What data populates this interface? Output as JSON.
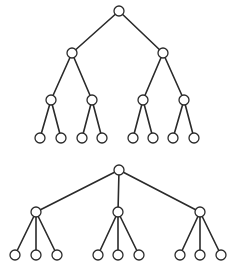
{
  "diagram": {
    "type": "tree-comparison",
    "style": {
      "line_color": "#2a2a2a",
      "node_fill": "#ffffff",
      "node_radius": 5
    },
    "trees": [
      {
        "name": "binary-tree",
        "branching_factor": 2,
        "depth": 3,
        "nodes": [
          {
            "id": "b0",
            "x": 119,
            "y": 11
          },
          {
            "id": "b1",
            "x": 72,
            "y": 53
          },
          {
            "id": "b2",
            "x": 163,
            "y": 53
          },
          {
            "id": "b3",
            "x": 51,
            "y": 100
          },
          {
            "id": "b4",
            "x": 92,
            "y": 100
          },
          {
            "id": "b5",
            "x": 143,
            "y": 100
          },
          {
            "id": "b6",
            "x": 184,
            "y": 100
          },
          {
            "id": "b7",
            "x": 40,
            "y": 138
          },
          {
            "id": "b8",
            "x": 61,
            "y": 138
          },
          {
            "id": "b9",
            "x": 82,
            "y": 138
          },
          {
            "id": "b10",
            "x": 102,
            "y": 138
          },
          {
            "id": "b11",
            "x": 133,
            "y": 138
          },
          {
            "id": "b12",
            "x": 153,
            "y": 138
          },
          {
            "id": "b13",
            "x": 173,
            "y": 138
          },
          {
            "id": "b14",
            "x": 194,
            "y": 138
          }
        ],
        "edges": [
          [
            "b0",
            "b1"
          ],
          [
            "b0",
            "b2"
          ],
          [
            "b1",
            "b3"
          ],
          [
            "b1",
            "b4"
          ],
          [
            "b2",
            "b5"
          ],
          [
            "b2",
            "b6"
          ],
          [
            "b3",
            "b7"
          ],
          [
            "b3",
            "b8"
          ],
          [
            "b4",
            "b9"
          ],
          [
            "b4",
            "b10"
          ],
          [
            "b5",
            "b11"
          ],
          [
            "b5",
            "b12"
          ],
          [
            "b6",
            "b13"
          ],
          [
            "b6",
            "b14"
          ]
        ]
      },
      {
        "name": "ternary-tree",
        "branching_factor": 3,
        "depth": 2,
        "nodes": [
          {
            "id": "t0",
            "x": 119,
            "y": 170
          },
          {
            "id": "t1",
            "x": 36,
            "y": 212
          },
          {
            "id": "t2",
            "x": 118,
            "y": 212
          },
          {
            "id": "t3",
            "x": 200,
            "y": 212
          },
          {
            "id": "t4",
            "x": 15,
            "y": 255
          },
          {
            "id": "t5",
            "x": 36,
            "y": 255
          },
          {
            "id": "t6",
            "x": 57,
            "y": 255
          },
          {
            "id": "t7",
            "x": 98,
            "y": 255
          },
          {
            "id": "t8",
            "x": 118,
            "y": 255
          },
          {
            "id": "t9",
            "x": 139,
            "y": 255
          },
          {
            "id": "t10",
            "x": 180,
            "y": 255
          },
          {
            "id": "t11",
            "x": 200,
            "y": 255
          },
          {
            "id": "t12",
            "x": 221,
            "y": 255
          }
        ],
        "edges": [
          [
            "t0",
            "t1"
          ],
          [
            "t0",
            "t2"
          ],
          [
            "t0",
            "t3"
          ],
          [
            "t1",
            "t4"
          ],
          [
            "t1",
            "t5"
          ],
          [
            "t1",
            "t6"
          ],
          [
            "t2",
            "t7"
          ],
          [
            "t2",
            "t8"
          ],
          [
            "t2",
            "t9"
          ],
          [
            "t3",
            "t10"
          ],
          [
            "t3",
            "t11"
          ],
          [
            "t3",
            "t12"
          ]
        ]
      }
    ]
  }
}
